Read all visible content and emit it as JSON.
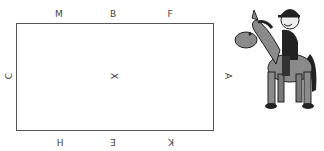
{
  "diagram": {
    "top_letters": [
      "M",
      "B",
      "F"
    ],
    "bottom_letters": [
      "H",
      "E",
      "K"
    ],
    "left_letter": "C",
    "right_letter": "A",
    "center_letter": "X"
  },
  "illustration": {
    "subject": "cartoon rider on horse"
  }
}
